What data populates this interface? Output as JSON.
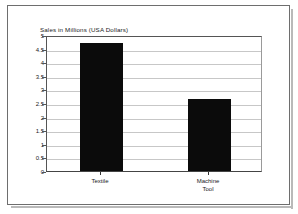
{
  "chart_data": {
    "type": "bar",
    "title": "Sales in Millions (USA Dollars)",
    "xlabel": "",
    "ylabel": "",
    "categories": [
      "Textile",
      "Machine\nTool"
    ],
    "values": [
      4.7,
      2.65
    ],
    "ylim": [
      0,
      5
    ],
    "yticks": [
      "0",
      "0.5",
      "1",
      "1.5",
      "2",
      "2.5",
      "3",
      "3.5",
      "4",
      "4.5",
      "5"
    ],
    "ytick_values": [
      0,
      0.5,
      1,
      1.5,
      2,
      2.5,
      3,
      3.5,
      4,
      4.5,
      5
    ],
    "grid": true,
    "legend": false,
    "series": [
      {
        "name": "Sales",
        "values": [
          4.7,
          2.65
        ],
        "color": "#0b0b0b"
      }
    ]
  },
  "colors": {
    "bar": "#0b0b0b",
    "gridline": "#c7c7c7",
    "axis": "#555555",
    "frame": "#6e6e6e",
    "text": "#1a1a1a",
    "background": "#ffffff"
  }
}
